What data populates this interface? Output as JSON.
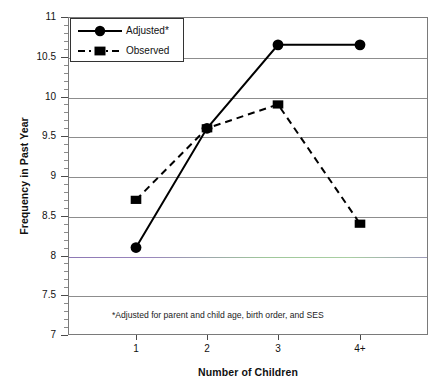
{
  "chart_data": {
    "type": "line",
    "title": "",
    "xlabel": "Number of Children",
    "ylabel": "Frequency in Past Year",
    "categories": [
      "1",
      "2",
      "3",
      "4+"
    ],
    "ylim": [
      7,
      11
    ],
    "ytick_labels": [
      "11",
      "10.5",
      "10",
      "9.5",
      "9",
      "8.5",
      "8",
      "7.5",
      "7"
    ],
    "ytick_values": [
      11,
      10.5,
      10,
      9.5,
      9,
      8.5,
      8,
      7.5,
      7
    ],
    "grid": true,
    "grid_axis": "y",
    "legend_position": "top-left",
    "series": [
      {
        "name": "Adjusted*",
        "values": [
          8.1,
          9.6,
          10.65,
          10.65
        ],
        "line_style": "solid",
        "marker": "circle",
        "color": "#000000"
      },
      {
        "name": "Observed",
        "values": [
          8.7,
          9.6,
          9.9,
          8.4
        ],
        "line_style": "dashed",
        "marker": "square",
        "color": "#000000"
      }
    ],
    "annotations": [
      {
        "text": "*Adjusted for parent and child age, birth order, and SES",
        "x": "2",
        "y": 7.3
      }
    ]
  },
  "legend": {
    "entries": [
      {
        "label": "Adjusted*",
        "marker": "circle-marker",
        "style": "solid"
      },
      {
        "label": "Observed",
        "marker": "square-marker",
        "style": "dashed"
      }
    ]
  },
  "footnote": "*Adjusted for parent and child age, birth order, and SES",
  "colors": {
    "line": "#000000",
    "grid": "#8d8d8d",
    "tinted_grid_left": "#8d78b4",
    "tinted_grid_right": "#9fc79a",
    "frame": "#7a7a7a",
    "text": "#111111",
    "background": "#ffffff"
  }
}
